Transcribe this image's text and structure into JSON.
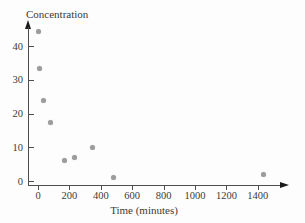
{
  "chart_data": {
    "type": "scatter",
    "title": "",
    "ylabel": "Concentration",
    "xlabel": "Time (minutes)",
    "x": [
      5,
      10,
      35,
      80,
      170,
      230,
      350,
      480,
      1435
    ],
    "y": [
      44.5,
      33.5,
      24,
      17.5,
      6,
      7,
      10,
      1,
      2
    ],
    "x_ticks": [
      0,
      200,
      400,
      600,
      800,
      1000,
      1200,
      1400
    ],
    "y_ticks": [
      0,
      10,
      20,
      30,
      40
    ],
    "xlim": [
      0,
      1580
    ],
    "ylim": [
      0,
      47
    ],
    "grid": false,
    "legend": "none",
    "colors": {
      "point": "#9c9c9c",
      "axis": "#4d4d4d",
      "text": "#3a3a3a"
    }
  }
}
